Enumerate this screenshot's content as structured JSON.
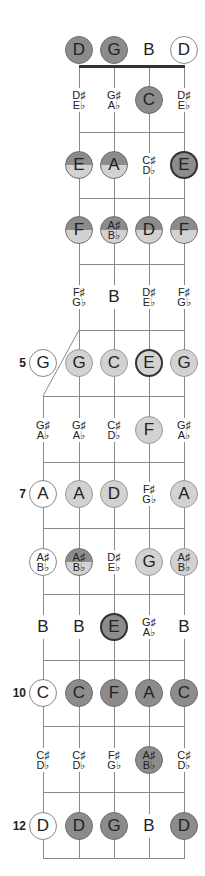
{
  "strings_x": [
    43,
    79,
    114,
    149,
    184
  ],
  "colors": {
    "dark_fill": "#8c8c8c",
    "light_fill": "#d2d2d2",
    "line": "#8a8a8a",
    "nut": "#333333"
  },
  "fret_markers": [
    {
      "fret": "5",
      "y": 363
    },
    {
      "fret": "7",
      "y": 494
    },
    {
      "fret": "10",
      "y": 693
    },
    {
      "fret": "12",
      "y": 826
    }
  ],
  "rows": [
    {
      "fret": 0,
      "y": 50,
      "notes": [
        {
          "s": 1,
          "text": "D",
          "style": "dark"
        },
        {
          "s": 2,
          "text": "G",
          "style": "dark"
        },
        {
          "s": 3,
          "text": "B",
          "style": "plain"
        },
        {
          "s": 4,
          "text": "D",
          "style": "open-circle"
        }
      ]
    },
    {
      "fret": 1,
      "y": 100,
      "notes": [
        {
          "s": 1,
          "l1": "D♯",
          "l2": "E♭",
          "style": "plain small"
        },
        {
          "s": 2,
          "l1": "G♯",
          "l2": "A♭",
          "style": "plain small"
        },
        {
          "s": 3,
          "text": "C",
          "style": "dark"
        },
        {
          "s": 4,
          "l1": "D♯",
          "l2": "E♭",
          "style": "plain small"
        }
      ]
    },
    {
      "fret": 2,
      "y": 165,
      "notes": [
        {
          "s": 1,
          "text": "E",
          "style": "split bold-ring"
        },
        {
          "s": 2,
          "text": "A",
          "style": "split"
        },
        {
          "s": 3,
          "l1": "C♯",
          "l2": "D♭",
          "style": "plain small"
        },
        {
          "s": 4,
          "text": "E",
          "style": "dark bold-ring"
        }
      ]
    },
    {
      "fret": 3,
      "y": 230,
      "notes": [
        {
          "s": 1,
          "text": "F",
          "style": "split"
        },
        {
          "s": 2,
          "l1": "A♯",
          "l2": "B♭",
          "style": "split small"
        },
        {
          "s": 3,
          "text": "D",
          "style": "split"
        },
        {
          "s": 4,
          "text": "F",
          "style": "split"
        }
      ]
    },
    {
      "fret": 4,
      "y": 297,
      "notes": [
        {
          "s": 1,
          "l1": "F♯",
          "l2": "G♭",
          "style": "plain small"
        },
        {
          "s": 2,
          "text": "B",
          "style": "plain"
        },
        {
          "s": 3,
          "l1": "D♯",
          "l2": "E♭",
          "style": "plain small"
        },
        {
          "s": 4,
          "l1": "F♯",
          "l2": "G♭",
          "style": "plain small"
        }
      ]
    },
    {
      "fret": 5,
      "y": 363,
      "notes": [
        {
          "s": 0,
          "text": "G",
          "style": "open-circle"
        },
        {
          "s": 1,
          "text": "G",
          "style": "light"
        },
        {
          "s": 2,
          "text": "C",
          "style": "light"
        },
        {
          "s": 3,
          "text": "E",
          "style": "light bold-ring"
        },
        {
          "s": 4,
          "text": "G",
          "style": "light"
        }
      ]
    },
    {
      "fret": 6,
      "y": 430,
      "notes": [
        {
          "s": 0,
          "l1": "G♯",
          "l2": "A♭",
          "style": "plain small"
        },
        {
          "s": 1,
          "l1": "G♯",
          "l2": "A♭",
          "style": "plain small"
        },
        {
          "s": 2,
          "l1": "C♯",
          "l2": "D♭",
          "style": "plain small"
        },
        {
          "s": 3,
          "text": "F",
          "style": "light"
        },
        {
          "s": 4,
          "l1": "G♯",
          "l2": "A♭",
          "style": "plain small"
        }
      ]
    },
    {
      "fret": 7,
      "y": 494,
      "notes": [
        {
          "s": 0,
          "text": "A",
          "style": "open-circle"
        },
        {
          "s": 1,
          "text": "A",
          "style": "light"
        },
        {
          "s": 2,
          "text": "D",
          "style": "light"
        },
        {
          "s": 3,
          "l1": "F♯",
          "l2": "G♭",
          "style": "plain small"
        },
        {
          "s": 4,
          "text": "A",
          "style": "light"
        }
      ]
    },
    {
      "fret": 8,
      "y": 562,
      "notes": [
        {
          "s": 0,
          "l1": "A♯",
          "l2": "B♭",
          "style": "open-circle small"
        },
        {
          "s": 1,
          "l1": "A♯",
          "l2": "B♭",
          "style": "split small"
        },
        {
          "s": 2,
          "l1": "D♯",
          "l2": "E♭",
          "style": "plain small"
        },
        {
          "s": 3,
          "text": "G",
          "style": "light"
        },
        {
          "s": 4,
          "l1": "A♯",
          "l2": "B♭",
          "style": "light small"
        }
      ]
    },
    {
      "fret": 9,
      "y": 627,
      "notes": [
        {
          "s": 0,
          "text": "B",
          "style": "plain"
        },
        {
          "s": 1,
          "text": "B",
          "style": "plain"
        },
        {
          "s": 2,
          "text": "E",
          "style": "dark bold-ring"
        },
        {
          "s": 3,
          "l1": "G♯",
          "l2": "A♭",
          "style": "plain small"
        },
        {
          "s": 4,
          "text": "B",
          "style": "plain"
        }
      ]
    },
    {
      "fret": 10,
      "y": 693,
      "notes": [
        {
          "s": 0,
          "text": "C",
          "style": "open-circle"
        },
        {
          "s": 1,
          "text": "C",
          "style": "dark"
        },
        {
          "s": 2,
          "text": "F",
          "style": "dark"
        },
        {
          "s": 3,
          "text": "A",
          "style": "dark"
        },
        {
          "s": 4,
          "text": "C",
          "style": "dark"
        }
      ]
    },
    {
      "fret": 11,
      "y": 760,
      "notes": [
        {
          "s": 0,
          "l1": "C♯",
          "l2": "D♭",
          "style": "plain small"
        },
        {
          "s": 1,
          "l1": "C♯",
          "l2": "D♭",
          "style": "plain small"
        },
        {
          "s": 2,
          "l1": "F♯",
          "l2": "G♭",
          "style": "plain small"
        },
        {
          "s": 3,
          "l1": "A♯",
          "l2": "B♭",
          "style": "dark small"
        },
        {
          "s": 4,
          "l1": "C♯",
          "l2": "D♭",
          "style": "plain small"
        }
      ]
    },
    {
      "fret": 12,
      "y": 826,
      "notes": [
        {
          "s": 0,
          "text": "D",
          "style": "open-circle"
        },
        {
          "s": 1,
          "text": "D",
          "style": "dark"
        },
        {
          "s": 2,
          "text": "G",
          "style": "dark"
        },
        {
          "s": 3,
          "text": "B",
          "style": "plain"
        },
        {
          "s": 4,
          "text": "D",
          "style": "dark"
        }
      ]
    }
  ],
  "frets_y": [
    132,
    198,
    264,
    330,
    396,
    462,
    528,
    594,
    660,
    726,
    792,
    858
  ]
}
